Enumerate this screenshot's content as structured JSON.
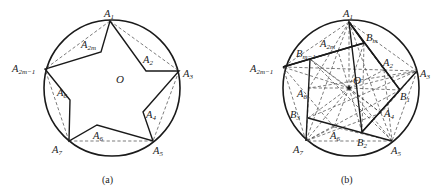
{
  "figure_a": {
    "caption": "(a)",
    "center_label": "O",
    "labels": {
      "A1": {
        "base": "A",
        "sub": "1"
      },
      "A2": {
        "base": "A",
        "sub": "2"
      },
      "A3": {
        "base": "A",
        "sub": "3"
      },
      "A4": {
        "base": "A",
        "sub": "4"
      },
      "A5": {
        "base": "A",
        "sub": "5"
      },
      "A6": {
        "base": "A",
        "sub": "6"
      },
      "A7": {
        "base": "A",
        "sub": "7"
      },
      "A8": {
        "base": "A",
        "sub": "8"
      },
      "A2m": {
        "base": "A",
        "sub": "2m"
      },
      "A2m1": {
        "base": "A",
        "sub": "2m−1"
      }
    }
  },
  "figure_b": {
    "caption": "(b)",
    "center_label": "O",
    "labels": {
      "A1": {
        "base": "A",
        "sub": "1"
      },
      "A2": {
        "base": "A",
        "sub": "2"
      },
      "A3": {
        "base": "A",
        "sub": "3"
      },
      "A4": {
        "base": "A",
        "sub": "4"
      },
      "A5": {
        "base": "A",
        "sub": "5"
      },
      "A6": {
        "base": "A",
        "sub": "6"
      },
      "A7": {
        "base": "A",
        "sub": "7"
      },
      "A8": {
        "base": "A",
        "sub": "8"
      },
      "A2m": {
        "base": "A",
        "sub": "2m"
      },
      "A2m1": {
        "base": "A",
        "sub": "2m−1"
      },
      "B1": {
        "base": "B",
        "sub": "1"
      },
      "B2": {
        "base": "B",
        "sub": "2"
      },
      "B3": {
        "base": "B",
        "sub": "3"
      },
      "Bm": {
        "base": "B",
        "sub": "m"
      },
      "Bm1": {
        "base": "B",
        "sub": "m−1"
      }
    }
  }
}
